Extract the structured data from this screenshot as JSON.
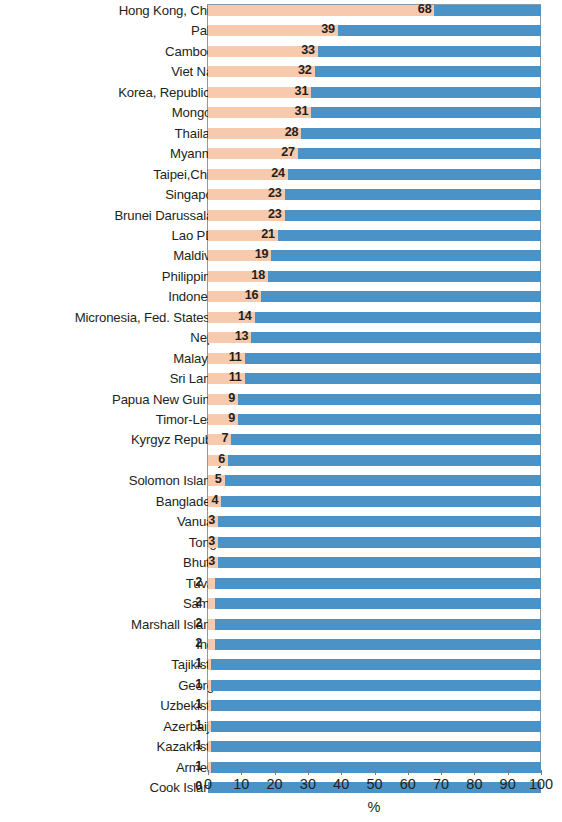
{
  "chart_data": {
    "type": "bar",
    "orientation": "horizontal",
    "stacked": true,
    "title": "",
    "subtitle": "",
    "xlabel": "%",
    "ylabel": "",
    "xlim": [
      0,
      100
    ],
    "xticks": [
      0,
      10,
      20,
      30,
      40,
      50,
      60,
      70,
      80,
      90,
      100
    ],
    "xtick_labels": [
      "0",
      "10",
      "20",
      "30",
      "40",
      "50",
      "60",
      "70",
      "80",
      "90",
      "100"
    ],
    "grid": false,
    "legend": null,
    "colors": {
      "segment_a": "#f7c9ad",
      "segment_b": "#4b93c6",
      "text": "#231f20",
      "frame": "#8c9aa6",
      "background": "#ffffff"
    },
    "series": [
      {
        "name": "segment-a",
        "color": "#f7c9ad"
      },
      {
        "name": "segment-b",
        "color": "#4b93c6"
      }
    ],
    "categories": [
      "Hong Kong, China",
      "Palau",
      "Cambodia",
      "Viet Nam",
      "Korea, Republic of",
      "Mongolia",
      "Thailand",
      "Myanmar",
      "Taipei,China",
      "Singapore",
      "Brunei Darussalam",
      "Lao PDR",
      "Maldives",
      "Philippines",
      "Indonesia",
      "Micronesia, Fed. States of",
      "Nepal",
      "Malaysia",
      "Sri Lanka",
      "Papua New Guinea",
      "Timor-Leste",
      "Kyrgyz Republic",
      "Fiji",
      "Solomon Islands",
      "Bangladesh",
      "Vanuatu",
      "Tonga",
      "Bhutan",
      "Tuvalu",
      "Samoa",
      "Marshall Islands",
      "India",
      "Tajikistan",
      "Georgia",
      "Uzbekistan",
      "Azerbaijan",
      "Kazakhstan",
      "Armenia",
      "Cook Islands"
    ],
    "values": [
      68,
      39,
      33,
      32,
      31,
      31,
      28,
      27,
      24,
      23,
      23,
      21,
      19,
      18,
      16,
      14,
      13,
      11,
      11,
      9,
      9,
      7,
      6,
      5,
      4,
      3,
      3,
      3,
      2,
      2,
      2,
      2,
      1,
      1,
      1,
      1,
      1,
      1,
      0
    ],
    "value_labels": [
      "68",
      "39",
      "33",
      "32",
      "31",
      "31",
      "28",
      "27",
      "24",
      "23",
      "23",
      "21",
      "19",
      "18",
      "16",
      "14",
      "13",
      "11",
      "11",
      "9",
      "9",
      "7",
      "6",
      "5",
      "4",
      "3",
      "3",
      "3",
      "2",
      "2",
      "2",
      "2",
      "1",
      "1",
      "1",
      "1",
      "1",
      "1",
      "0"
    ]
  }
}
